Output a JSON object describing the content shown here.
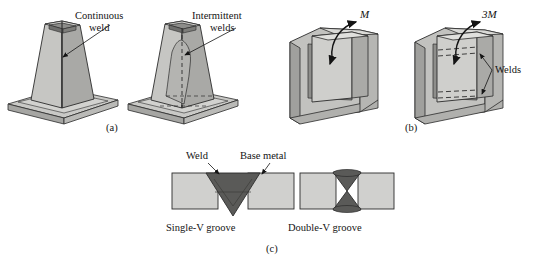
{
  "figure": {
    "background_color": "#ffffff",
    "ink_color": "#141414"
  },
  "palette": {
    "metal_light": "#d6d6d4",
    "metal_mid": "#b9b9b6",
    "metal_dark": "#9a9a97",
    "metal_darker": "#7e7e7b",
    "weld_dark": "#5a5a58",
    "outline": "#2b2b2b",
    "base_metal": "#d0d0ce"
  },
  "panels": [
    {
      "id": "a",
      "caption": "(a)",
      "subject": "tapered hollow column welded to base plate",
      "annotations": [
        {
          "name": "continuous-weld",
          "text": "Continuous\nweld"
        },
        {
          "name": "intermittent-welds",
          "text": "Intermittent\nwelds"
        }
      ]
    },
    {
      "id": "b",
      "caption": "(b)",
      "subject": "bracket plate in slotted block under moment load",
      "annotations": [
        {
          "name": "moment-m",
          "text": "M"
        },
        {
          "name": "moment-3m",
          "text": "3M"
        },
        {
          "name": "welds",
          "text": "Welds"
        }
      ]
    },
    {
      "id": "c",
      "caption": "(c)",
      "subject": "groove weld cross sections",
      "annotations": [
        {
          "name": "weld",
          "text": "Weld"
        },
        {
          "name": "base-metal",
          "text": "Base metal"
        }
      ],
      "items": [
        {
          "name": "single-v-groove",
          "label": "Single-V groove"
        },
        {
          "name": "double-v-groove",
          "label": "Double-V groove"
        }
      ]
    }
  ],
  "labels": {
    "continuous_weld_line1": "Continuous",
    "continuous_weld_line2": "weld",
    "intermittent_line1": "Intermittent",
    "intermittent_line2": "welds",
    "welds": "Welds",
    "weld": "Weld",
    "base_metal": "Base metal",
    "single_v": "Single-V groove",
    "double_v": "Double-V groove",
    "moment_m": "M",
    "moment_3m": "3M",
    "caption_a": "(a)",
    "caption_b": "(b)",
    "caption_c": "(c)"
  }
}
